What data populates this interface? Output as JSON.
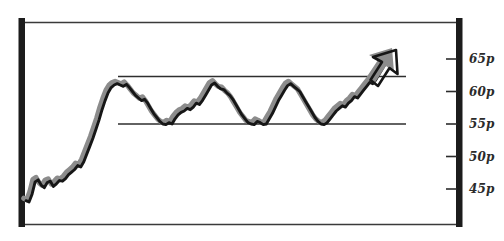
{
  "chart_data": {
    "type": "line",
    "title": "",
    "subtitle": "",
    "xlabel": "",
    "ylabel": "",
    "ylim": [
      42,
      68
    ],
    "grid": false,
    "legend_position": "none",
    "y_tick_labels": [
      "65p",
      "60p",
      "55p",
      "50p",
      "45p"
    ],
    "y_tick_values": [
      65,
      60,
      55,
      50,
      45
    ],
    "annotations": [
      {
        "name": "resistance-line",
        "label": "",
        "type": "horizontal-line",
        "value": 61.2,
        "x_start": 0.22,
        "x_end": 0.88
      },
      {
        "name": "support-line",
        "label": "",
        "type": "horizontal-line",
        "value": 55.0,
        "x_start": 0.22,
        "x_end": 0.88
      },
      {
        "name": "breakout-arrow",
        "label": "",
        "type": "arrow-head",
        "direction": "up-right"
      }
    ],
    "series": [
      {
        "name": "price",
        "color": "#1a1a1a",
        "shadow_color": "#8c8c8c",
        "values": [
          43.2,
          43.0,
          44.2,
          46.1,
          46.4,
          45.6,
          45.2,
          46.0,
          46.2,
          45.4,
          45.8,
          46.3,
          46.2,
          46.6,
          47.2,
          47.6,
          48.0,
          48.6,
          48.4,
          49.2,
          50.4,
          51.6,
          52.8,
          54.2,
          55.6,
          57.2,
          58.6,
          59.8,
          60.6,
          61.0,
          61.2,
          61.0,
          60.8,
          61.1,
          60.6,
          60.0,
          59.4,
          59.0,
          58.6,
          58.8,
          58.2,
          57.4,
          56.6,
          56.0,
          55.4,
          55.0,
          54.9,
          55.2,
          55.0,
          55.8,
          56.4,
          56.8,
          57.0,
          57.4,
          57.2,
          57.6,
          58.2,
          58.0,
          58.6,
          59.4,
          60.2,
          61.0,
          61.3,
          60.8,
          60.4,
          60.3,
          59.8,
          59.4,
          58.8,
          58.0,
          57.2,
          56.4,
          55.8,
          55.2,
          55.0,
          54.9,
          55.4,
          55.2,
          54.9,
          55.0,
          55.8,
          56.6,
          57.6,
          58.6,
          59.4,
          60.2,
          60.9,
          61.2,
          60.8,
          60.4,
          60.0,
          59.2,
          58.4,
          57.6,
          56.8,
          56.0,
          55.4,
          55.0,
          54.9,
          55.2,
          55.8,
          56.4,
          57.0,
          57.4,
          57.8,
          57.6,
          58.2,
          58.6,
          59.2,
          59.0,
          59.6,
          60.2,
          60.8,
          61.4,
          61.2,
          61.8,
          62.6,
          63.4,
          64.2,
          65.0
        ]
      }
    ]
  },
  "axis": {
    "left_rail_name": "left-axis-rail",
    "right_rail_name": "right-axis-rail",
    "top_border_name": "top-border",
    "bottom_border_name": "bottom-border"
  }
}
